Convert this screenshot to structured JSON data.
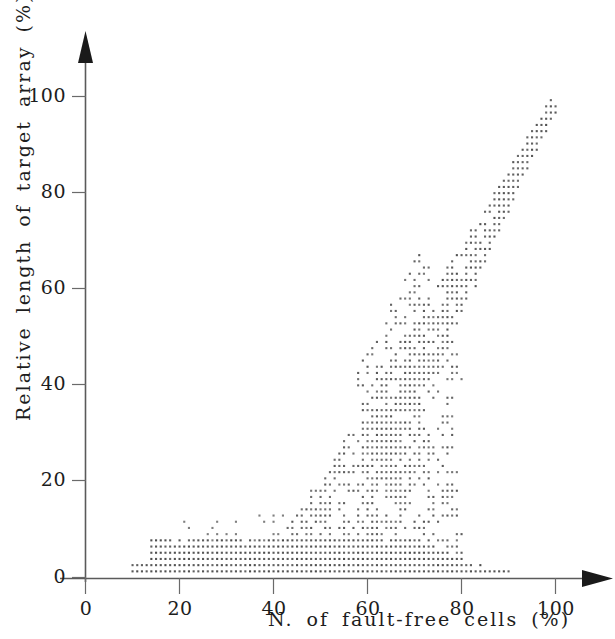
{
  "chart_data": {
    "type": "scatter",
    "title": "",
    "xlabel": "N. of fault-free cells (%)",
    "ylabel": "Relative length of target array (%)",
    "xlim": [
      0,
      105
    ],
    "ylim": [
      0,
      105
    ],
    "xticks": [
      0,
      20,
      40,
      60,
      80,
      100
    ],
    "yticks": [
      0,
      20,
      40,
      60,
      80,
      100
    ],
    "xtick_labels": [
      "0",
      "20",
      "40",
      "60",
      "80",
      "100"
    ],
    "ytick_labels": [
      "0",
      "20",
      "40",
      "60",
      "80",
      "100"
    ],
    "grid": false,
    "legend": null,
    "marker": "tiny-square-dot",
    "marker_color": "#4a4a4a",
    "axis_color": "#5a5a5a",
    "axis_style": "arrow-tipped-open-axes",
    "series": [
      {
        "name": "simulation runs",
        "points_note": "Points generated on a fine lattice; the three structural components listed below reproduce the visual density.",
        "components": [
          {
            "name": "baseline-band",
            "shape": "band",
            "x_range": [
              10,
              90
            ],
            "y_range": [
              0,
              8
            ],
            "density": "very-high",
            "comment": "Thick near-zero band spanning most of the x axis, thickest between x=10 and x=70."
          },
          {
            "name": "rising-scatter",
            "shape": "wedge",
            "x_range": [
              38,
              80
            ],
            "y_range": [
              0,
              55
            ],
            "density": "medium",
            "comment": "Sparse scatter fanning upward as fault-free cell count grows."
          },
          {
            "name": "diagonal-ridge",
            "shape": "line-cloud",
            "x_range": [
              60,
              100
            ],
            "y_range": [
              25,
              99
            ],
            "slope": 1.8,
            "density": "high",
            "comment": "Tight, nearly linear ridge reaching (100, 98) at the top right."
          }
        ],
        "extremes": {
          "x_min": 10,
          "x_max": 100,
          "y_min": 0,
          "y_max": 98
        }
      }
    ]
  },
  "axes": {
    "x_axis_name": "x-axis",
    "y_axis_name": "y-axis"
  }
}
